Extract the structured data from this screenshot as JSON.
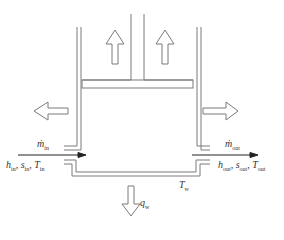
{
  "diagram": {
    "labels": {
      "m_in": {
        "sym": "ṁ",
        "sub": "in"
      },
      "m_out": {
        "sym": "ṁ",
        "sub": "out"
      },
      "in_props": [
        {
          "sym": "h",
          "sub": "in"
        },
        {
          "sym": "s",
          "sub": "in"
        },
        {
          "sym": "T",
          "sub": "in"
        }
      ],
      "out_props": [
        {
          "sym": "h",
          "sub": "out"
        },
        {
          "sym": "s",
          "sub": "out"
        },
        {
          "sym": "T",
          "sub": "out"
        }
      ],
      "separator": ",",
      "wall_temp": {
        "sym": "T",
        "sub": "w"
      },
      "heat_loss": {
        "sym": "q",
        "sub": "w"
      }
    },
    "colors": {
      "line": "#777777",
      "arrow": "#222222",
      "text": "#333333"
    }
  }
}
